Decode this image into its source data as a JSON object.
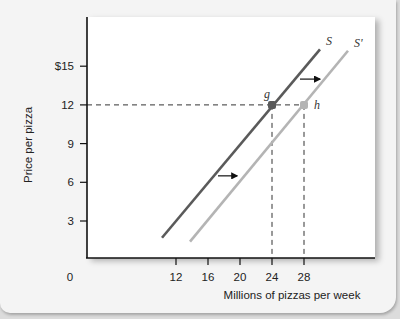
{
  "chart_data": {
    "type": "line",
    "title": "",
    "xlabel": "Millions of pizzas per week",
    "ylabel": "Price per pizza",
    "origin_label": "0",
    "x_ticks": [
      12,
      16,
      20,
      24,
      28
    ],
    "x_tick_labels": [
      "12",
      "16",
      "20",
      "24",
      "28"
    ],
    "y_ticks": [
      3,
      6,
      9,
      12,
      15
    ],
    "y_tick_labels": [
      "3",
      "6",
      "9",
      "12",
      "$15"
    ],
    "xlim": [
      0,
      37
    ],
    "ylim": [
      0,
      18.5
    ],
    "grid": false,
    "legend": "none",
    "series": [
      {
        "name": "S",
        "color": "#5a5a5a",
        "points": [
          [
            10.25,
            1.7
          ],
          [
            24,
            12
          ],
          [
            30,
            16.3
          ]
        ]
      },
      {
        "name": "S'",
        "color": "#b4b4b4",
        "points": [
          [
            13.75,
            1.4
          ],
          [
            28,
            12
          ],
          [
            33.5,
            16.2
          ]
        ]
      }
    ],
    "annotations": [
      {
        "type": "point",
        "label": "g",
        "x": 24,
        "y": 12,
        "color": "#5a5a5a"
      },
      {
        "type": "point",
        "label": "h",
        "x": 28,
        "y": 12,
        "color": "#b4b4b4"
      },
      {
        "type": "dashed_hline",
        "y": 12,
        "x_from": 0,
        "x_to": 28
      },
      {
        "type": "dashed_vline",
        "x": 24,
        "y_from": 0,
        "y_to": 12
      },
      {
        "type": "dashed_vline",
        "x": 28,
        "y_from": 0,
        "y_to": 12
      },
      {
        "type": "arrow",
        "direction": "right",
        "from": [
          27.5,
          14
        ],
        "to": [
          30.25,
          14
        ],
        "meaning": "supply shifts right"
      },
      {
        "type": "arrow",
        "direction": "right",
        "from": [
          17.25,
          6.5
        ],
        "to": [
          19.9,
          6.5
        ],
        "meaning": "supply shifts right"
      }
    ]
  }
}
